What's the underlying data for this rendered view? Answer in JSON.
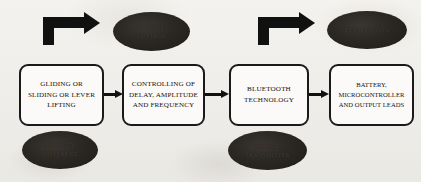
{
  "diagram": {
    "background_color": "#f2f0ec",
    "stroke_color": "#111111",
    "box_fill_color": "#fbfaf8",
    "ellipse_fill_color": "#2b2823",
    "stages": [
      {
        "id": "stage-1",
        "lines": [
          "GLIDING OR",
          "SLIDING OR LEVER",
          "LIFTING"
        ]
      },
      {
        "id": "stage-2",
        "lines": [
          "CONTROLLING OF",
          "DELAY, AMPLITUDE",
          "AND FREQUENCY"
        ]
      },
      {
        "id": "stage-3",
        "lines": [
          "BLUETOOTH",
          "TECHNOLOGY"
        ]
      },
      {
        "id": "stage-4",
        "lines": [
          "BATTERY,",
          "MICROCONTROLLER",
          "AND OUTPUT LEADS"
        ]
      }
    ],
    "callouts": [
      {
        "id": "callout-remote-control",
        "position": "top-left",
        "lines": [
          "REMOTE",
          "CONTROL"
        ]
      },
      {
        "id": "callout-beam-fitting",
        "position": "top-right",
        "lines": [
          "BEAM FITTING"
        ]
      },
      {
        "id": "callout-activity-different",
        "position": "bottom-left",
        "lines": [
          "ACTIVITY",
          "DIFFERENT"
        ]
      },
      {
        "id": "callout-sensor-transmitter",
        "position": "bottom-middle",
        "lines": [
          "SENSOR",
          "TRANSMITTER"
        ]
      }
    ],
    "connectors": [
      {
        "id": "connector-1-2",
        "from": "stage-1",
        "to": "stage-2",
        "style": "straight-arrow"
      },
      {
        "id": "connector-2-3",
        "from": "stage-2",
        "to": "stage-3",
        "style": "straight-arrow"
      },
      {
        "id": "connector-3-4",
        "from": "stage-3",
        "to": "stage-4",
        "style": "straight-arrow"
      }
    ],
    "elbow_arrows": [
      {
        "id": "elbow-arrow-left",
        "points_to": "callout-remote-control",
        "style": "bent-right"
      },
      {
        "id": "elbow-arrow-right",
        "points_to": "callout-beam-fitting",
        "style": "bent-right"
      }
    ]
  }
}
